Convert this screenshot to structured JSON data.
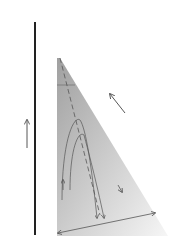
{
  "diagram": {
    "type": "wedge-flow-schematic",
    "labels": {
      "angle": "θ",
      "upper_velocity": "u",
      "left_velocity": "u",
      "width": "h"
    },
    "colors": {
      "wall": "#222222",
      "molecule_head": "#555555",
      "molecule_tail": "#777777",
      "wedge_fill_dark": "#a8a8a8",
      "wedge_fill_light": "#f4f4f4",
      "arrow": "#555555"
    }
  }
}
